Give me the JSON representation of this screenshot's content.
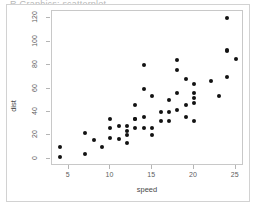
{
  "figure": {
    "title_sliver": "R Graphics: scatterplot",
    "background_color": "#ffffff",
    "frame_color": "#d2d2d2",
    "panel_border_color": "#c8c8c8",
    "point_color": "#121212",
    "axis_text_color": "#5d5d5d"
  },
  "chart_data": {
    "type": "scatter",
    "title": "",
    "xlabel": "speed",
    "ylabel": "dist",
    "xlim": [
      3.0,
      26.0
    ],
    "ylim": [
      -6.0,
      126.0
    ],
    "xticks": [
      5,
      10,
      15,
      20,
      25
    ],
    "yticks": [
      0,
      20,
      40,
      60,
      80,
      100,
      120
    ],
    "xtick_labels": [
      "5",
      "10",
      "15",
      "20",
      "25"
    ],
    "ytick_labels": [
      "0",
      "20",
      "40",
      "60",
      "80",
      "100",
      "120"
    ],
    "grid": false,
    "legend": null,
    "marker": "filled-circle",
    "series": [
      {
        "name": "cars",
        "x": [
          4,
          4,
          7,
          7,
          8,
          9,
          10,
          10,
          10,
          11,
          11,
          12,
          12,
          12,
          12,
          13,
          13,
          13,
          13,
          14,
          14,
          14,
          14,
          15,
          15,
          15,
          16,
          16,
          17,
          17,
          17,
          18,
          18,
          18,
          18,
          19,
          19,
          19,
          20,
          20,
          20,
          20,
          20,
          22,
          23,
          24,
          24,
          24,
          24,
          25
        ],
        "y": [
          2,
          10,
          4,
          22,
          16,
          10,
          18,
          26,
          34,
          17,
          28,
          14,
          20,
          24,
          28,
          26,
          34,
          34,
          46,
          26,
          36,
          60,
          80,
          20,
          26,
          54,
          32,
          40,
          32,
          40,
          50,
          42,
          56,
          76,
          84,
          36,
          46,
          68,
          32,
          48,
          52,
          56,
          64,
          66,
          54,
          70,
          92,
          93,
          120,
          85
        ]
      }
    ]
  }
}
